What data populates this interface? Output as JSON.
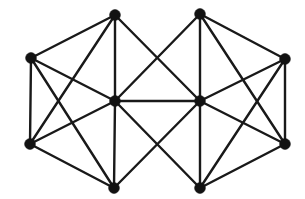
{
  "figure": {
    "kind": "node-link-diagram",
    "background_color": "#ffffff",
    "canvas": {
      "width": 305,
      "height": 199
    }
  },
  "style": {
    "edge_color": "#191919",
    "edge_width": 2.4,
    "vertex_color": "#121212",
    "vertex_radius": 5.4
  },
  "graph": {
    "vertex_count": 10,
    "edge_count": 27,
    "vertices": [
      {
        "id": "v1",
        "label": "top-left",
        "x": 115,
        "y": 15
      },
      {
        "id": "v2",
        "label": "top-right",
        "x": 200,
        "y": 14
      },
      {
        "id": "v3",
        "label": "left",
        "x": 31,
        "y": 58
      },
      {
        "id": "v4",
        "label": "right",
        "x": 285,
        "y": 59
      },
      {
        "id": "v5",
        "label": "center-left",
        "x": 115,
        "y": 101
      },
      {
        "id": "v6",
        "label": "center-right",
        "x": 200,
        "y": 101
      },
      {
        "id": "v7",
        "label": "bottom-left",
        "x": 30,
        "y": 144
      },
      {
        "id": "v8",
        "label": "bottom-right",
        "x": 285,
        "y": 144
      },
      {
        "id": "v9",
        "label": "bottom-center-left",
        "x": 114,
        "y": 188
      },
      {
        "id": "v10",
        "label": "bottom-center-right",
        "x": 200,
        "y": 188
      }
    ],
    "edges": [
      {
        "source": "v1",
        "target": "v3"
      },
      {
        "source": "v1",
        "target": "v5"
      },
      {
        "source": "v1",
        "target": "v7"
      },
      {
        "source": "v1",
        "target": "v6"
      },
      {
        "source": "v2",
        "target": "v4"
      },
      {
        "source": "v2",
        "target": "v6"
      },
      {
        "source": "v2",
        "target": "v8"
      },
      {
        "source": "v2",
        "target": "v5"
      },
      {
        "source": "v3",
        "target": "v5"
      },
      {
        "source": "v3",
        "target": "v7"
      },
      {
        "source": "v3",
        "target": "v9"
      },
      {
        "source": "v4",
        "target": "v6"
      },
      {
        "source": "v4",
        "target": "v8"
      },
      {
        "source": "v4",
        "target": "v10"
      },
      {
        "source": "v5",
        "target": "v6"
      },
      {
        "source": "v5",
        "target": "v7"
      },
      {
        "source": "v5",
        "target": "v9"
      },
      {
        "source": "v5",
        "target": "v10"
      },
      {
        "source": "v6",
        "target": "v8"
      },
      {
        "source": "v6",
        "target": "v10"
      },
      {
        "source": "v6",
        "target": "v9"
      },
      {
        "source": "v7",
        "target": "v9"
      },
      {
        "source": "v8",
        "target": "v10"
      }
    ]
  }
}
